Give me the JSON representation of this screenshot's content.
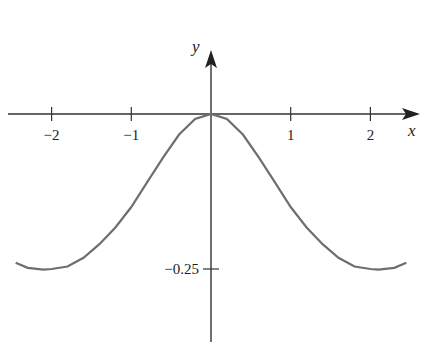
{
  "chart_data": {
    "type": "line",
    "title": "",
    "xlabel": "x",
    "ylabel": "y",
    "xticks": [
      -2,
      -1,
      1,
      2
    ],
    "xtick_labels": [
      "−2",
      "−1",
      "1",
      "2"
    ],
    "yticks": [
      -0.25
    ],
    "ytick_labels": [
      "−0.25"
    ],
    "xlim": [
      -2.5,
      2.5
    ],
    "ylim": [
      -0.37,
      0.15
    ],
    "grid": false,
    "series": [
      {
        "name": "curve",
        "x": [
          -2.45,
          -2.3,
          -2.1,
          -2.0,
          -1.8,
          -1.6,
          -1.4,
          -1.2,
          -1.0,
          -0.8,
          -0.6,
          -0.4,
          -0.2,
          0,
          0.2,
          0.4,
          0.6,
          0.8,
          1.0,
          1.2,
          1.4,
          1.6,
          1.8,
          2.0,
          2.1,
          2.3,
          2.45
        ],
        "y": [
          -0.24,
          -0.248,
          -0.251,
          -0.25,
          -0.246,
          -0.232,
          -0.21,
          -0.183,
          -0.15,
          -0.11,
          -0.07,
          -0.033,
          -0.008,
          0,
          -0.008,
          -0.033,
          -0.07,
          -0.11,
          -0.15,
          -0.183,
          -0.21,
          -0.232,
          -0.246,
          -0.25,
          -0.251,
          -0.248,
          -0.24
        ]
      }
    ]
  }
}
